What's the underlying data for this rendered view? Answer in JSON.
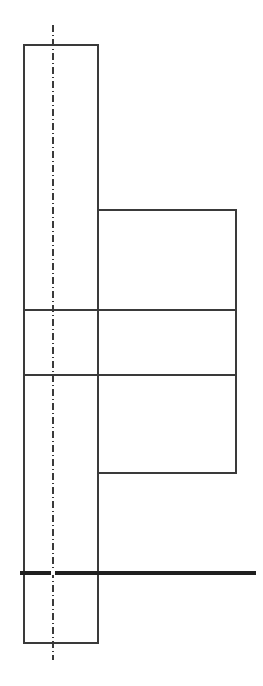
{
  "document": {
    "kind": "engineering-cross-section-drawing",
    "view_label": "",
    "background_color": "#ffffff",
    "canvas": {
      "width": 263,
      "height": 686
    }
  },
  "styles": {
    "outline_color": "#3a3a3a",
    "outline_width": 1.6,
    "axis_color": "#1f1f1f",
    "axis_width": 3.2,
    "centerline_color": "#3a3a3a",
    "centerline_width": 1.6,
    "centerline_dash": "7 3 1 3"
  },
  "geometry": {
    "flange_rectangle": {
      "name": "tall-flange-body",
      "x": 24,
      "y": 45,
      "width": 74,
      "height": 598,
      "right_x": 98,
      "bottom_y": 643
    },
    "hub_block": {
      "name": "right-hub-block",
      "x": 98,
      "y": 210,
      "width": 138,
      "height": 263,
      "right_x": 236,
      "bottom_y": 473
    },
    "divider_upper": {
      "name": "upper-divider-line",
      "x1": 24,
      "y1": 310,
      "x2": 236,
      "y2": 310
    },
    "divider_lower": {
      "name": "lower-divider-line",
      "x1": 24,
      "y1": 375,
      "x2": 236,
      "y2": 375
    },
    "vertical_centerline": {
      "name": "vertical-axis-centerline",
      "x": 53,
      "y_top": 25,
      "y_bottom": 660
    },
    "horizontal_axis": {
      "name": "horizontal-axis-line",
      "x1": 20,
      "y1": 573,
      "x2": 256,
      "y2": 573
    },
    "center_mark": {
      "name": "axis-intersection-point",
      "cx": 53,
      "cy": 573,
      "radius": 2.4
    }
  },
  "annotations": {
    "title": "",
    "dimensions": [],
    "notes": []
  }
}
